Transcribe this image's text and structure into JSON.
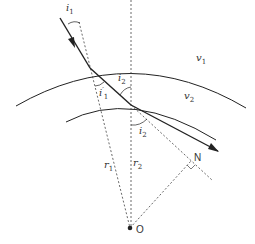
{
  "diagram": {
    "labels": {
      "i1": {
        "base": "i",
        "sub": "1"
      },
      "i1p": {
        "base": "i",
        "sub": "1",
        "prime": "′"
      },
      "i2_top": {
        "base": "i",
        "sub": "2"
      },
      "i2_bottom": {
        "base": "i",
        "sub": "2"
      },
      "v1": {
        "base": "v",
        "sub": "1"
      },
      "v2": {
        "base": "v",
        "sub": "2"
      },
      "r1": {
        "base": "r",
        "sub": "1"
      },
      "r2": {
        "base": "r",
        "sub": "2"
      },
      "N": "N",
      "O": "O"
    },
    "colors": {
      "line": "#222222",
      "dashed": "#444444",
      "text": "#333333"
    }
  }
}
